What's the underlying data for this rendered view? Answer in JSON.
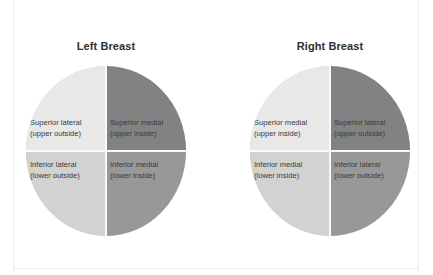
{
  "colors": {
    "light_quadrant": "#e8e8e8",
    "medium_light_quadrant": "#d2d2d2",
    "dark_quadrant": "#828282",
    "medium_dark_quadrant": "#989898",
    "divider": "#fbfbfb",
    "title_text": "#2f2f2f",
    "label_text": "#3a3a3a",
    "frame_line": "#ededed",
    "background": "#ffffff"
  },
  "diagrams": [
    {
      "id": "left-breast",
      "title": "Left Breast",
      "quadrants": {
        "top_left": {
          "name": "Superior lateral",
          "detail": "(upper outside)",
          "fill": "#e8e8e8"
        },
        "top_right": {
          "name": "Superior medial",
          "detail": "(upper inside)",
          "fill": "#828282"
        },
        "bottom_left": {
          "name": "Inferior lateral",
          "detail": "(lower outside)",
          "fill": "#d2d2d2"
        },
        "bottom_right": {
          "name": "Inferior medial",
          "detail": "(lower inside)",
          "fill": "#989898"
        }
      }
    },
    {
      "id": "right-breast",
      "title": "Right Breast",
      "quadrants": {
        "top_left": {
          "name": "Superior medial",
          "detail": "(upper inside)",
          "fill": "#e8e8e8"
        },
        "top_right": {
          "name": "Superior lateral",
          "detail": "(upper outside)",
          "fill": "#828282"
        },
        "bottom_left": {
          "name": "Inferior medial",
          "detail": "(lower inside)",
          "fill": "#d2d2d2"
        },
        "bottom_right": {
          "name": "Inferior lateral",
          "detail": "(lower outside)",
          "fill": "#989898"
        }
      }
    }
  ]
}
